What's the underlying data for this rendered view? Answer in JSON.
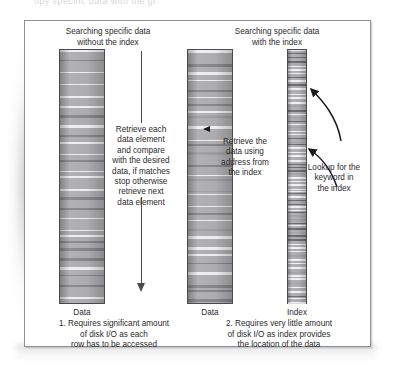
{
  "page": {
    "top_cut_text": "opy specific data with the gi"
  },
  "figure": {
    "headings": {
      "left": "Searching specific data\nwithout the index",
      "right": "Searching specific data\nwith the index"
    },
    "bars": [
      {
        "name": "data-left",
        "label": "Data",
        "kind": "data"
      },
      {
        "name": "data-mid",
        "label": "Data",
        "kind": "data"
      },
      {
        "name": "index",
        "label": "Index",
        "kind": "index"
      }
    ],
    "annotations": {
      "scan": "Retrieve each\ndata element\nand compare\nwith the desired\ndata, if matches\nstop otherwise\nretrieve next\ndata element",
      "fetch": "Retrieve the\ndata using\naddress from\nthe index",
      "lookup": "Lookup for the\nkeyword in\nthe index"
    },
    "captions": {
      "one": "1. Requires significant amount\nof disk I/O as each\nrow has to be accessed",
      "two": "2. Requires very little amount\nof disk I/O as index provides\nthe location of the data"
    },
    "icons": {
      "down_arrow": "down-arrow",
      "left_arrowhead": "left-arrowhead",
      "curved_arrow_upper": "curved-arrow",
      "curved_arrow_lower": "curved-arrow"
    },
    "colors": {
      "frame_border": "#8e9094",
      "bar_fill": "#a9a9ab",
      "bar_border": "#4a4a4c",
      "text": "#2a2a2c",
      "arrow": "#4a4a4c"
    }
  }
}
